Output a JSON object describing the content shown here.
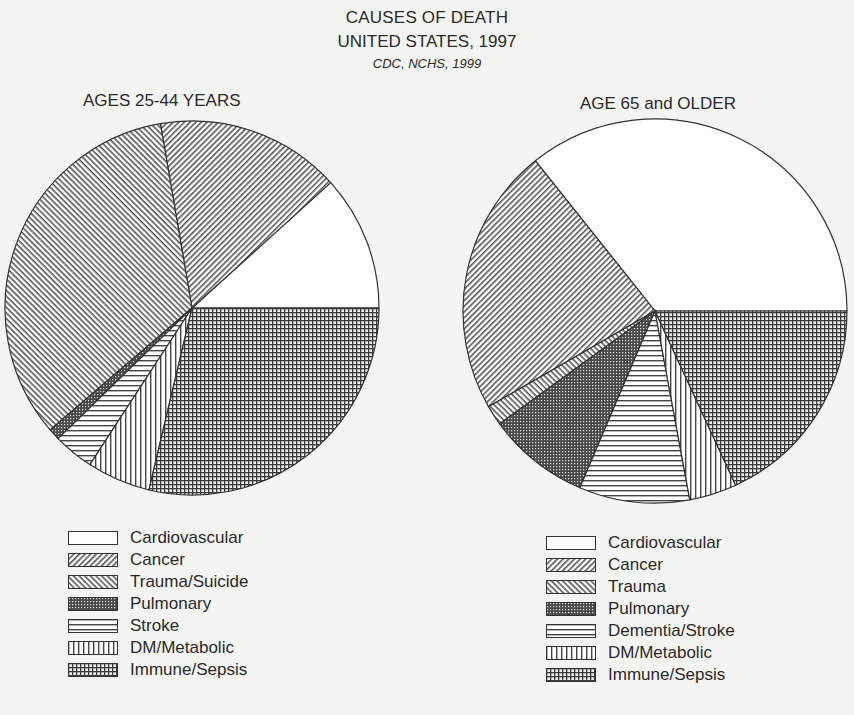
{
  "header": {
    "title": "CAUSES OF DEATH",
    "subtitle": "UNITED STATES, 1997",
    "source": "CDC, NCHS, 1999"
  },
  "left_chart": {
    "title": "AGES 25-44 YEARS",
    "legend": [
      "Cardiovascular",
      "Cancer",
      "Trauma/Suicide",
      "Pulmonary",
      "Stroke",
      "DM/Metabolic",
      "Immune/Sepsis"
    ]
  },
  "right_chart": {
    "title": "AGE 65 and OLDER",
    "legend": [
      "Cardiovascular",
      "Cancer",
      "Trauma",
      "Pulmonary",
      "Dementia/Stroke",
      "DM/Metabolic",
      "Immune/Sepsis"
    ]
  },
  "chart_data": [
    {
      "type": "pie",
      "title": "AGES 25-44 YEARS",
      "suptitle": "CAUSES OF DEATH UNITED STATES, 1997",
      "source": "CDC, NCHS, 1999",
      "categories": [
        "Cardiovascular",
        "Cancer",
        "Trauma/Suicide",
        "Pulmonary",
        "Stroke",
        "DM/Metabolic",
        "Immune/Sepsis"
      ],
      "values": [
        11.7,
        16.0,
        33.6,
        1.0,
        3.5,
        5.5,
        28.7
      ],
      "units": "percent (estimated from slice angles)",
      "patterns": [
        "blank",
        "diagonal-up",
        "diagonal-down",
        "fine-dots",
        "horizontal-lines",
        "vertical-lines",
        "crosshatch"
      ],
      "legend_position": "bottom"
    },
    {
      "type": "pie",
      "title": "AGE 65 and OLDER",
      "suptitle": "CAUSES OF DEATH UNITED STATES, 1997",
      "source": "CDC, NCHS, 1999",
      "categories": [
        "Cardiovascular",
        "Cancer",
        "Trauma",
        "Pulmonary",
        "Dementia/Stroke",
        "DM/Metabolic",
        "Immune/Sepsis"
      ],
      "values": [
        35.7,
        22.6,
        1.7,
        8.6,
        9.3,
        4.0,
        18.1
      ],
      "units": "percent (estimated from slice angles)",
      "patterns": [
        "blank",
        "diagonal-up",
        "diagonal-down",
        "fine-dots",
        "horizontal-lines",
        "vertical-lines",
        "crosshatch"
      ],
      "legend_position": "bottom"
    }
  ]
}
